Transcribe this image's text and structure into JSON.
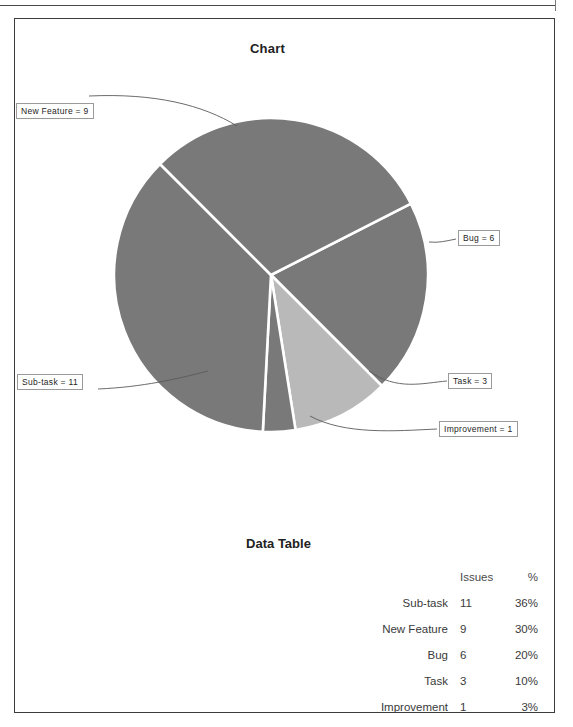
{
  "page": {
    "chart_title": "Chart",
    "table_title": "Data Table"
  },
  "callouts": {
    "new_feature": "New Feature = 9",
    "bug": "Bug = 6",
    "task": "Task = 3",
    "improvement": "Improvement = 1",
    "sub_task": "Sub-task = 11"
  },
  "table": {
    "headers": {
      "name": "",
      "issues": "Issues",
      "pct": "%"
    },
    "rows": [
      {
        "name": "Sub-task",
        "issues": "11",
        "pct": "36%"
      },
      {
        "name": "New Feature",
        "issues": "9",
        "pct": "30%"
      },
      {
        "name": "Bug",
        "issues": "6",
        "pct": "20%"
      },
      {
        "name": "Task",
        "issues": "3",
        "pct": "10%"
      },
      {
        "name": "Improvement",
        "issues": "1",
        "pct": "3%"
      }
    ]
  },
  "chart_data": {
    "type": "pie",
    "title": "Chart",
    "categories": [
      "Sub-task",
      "New Feature",
      "Bug",
      "Task",
      "Improvement"
    ],
    "values": [
      11,
      9,
      6,
      3,
      1
    ],
    "percents": [
      36,
      30,
      20,
      10,
      3
    ],
    "total": 30,
    "value_label": "Issues",
    "labels": [
      "Sub-task = 11",
      "New Feature = 9",
      "Bug = 6",
      "Task = 3",
      "Improvement = 1"
    ],
    "colors": [
      "#797979",
      "#797979",
      "#797979",
      "#b9b9b9",
      "#797979"
    ],
    "slice_separator_color": "#ffffff",
    "legend": "none",
    "grid": false,
    "center": [
      256,
      256
    ],
    "radius": 157
  },
  "colors": {
    "slice_dark": "#797979",
    "slice_light": "#b9b9b9",
    "frame_border": "#3c3c3c",
    "callout_border": "#9a9a9a",
    "leader_line": "#5a5a5a",
    "text": "#2b2b2b"
  }
}
